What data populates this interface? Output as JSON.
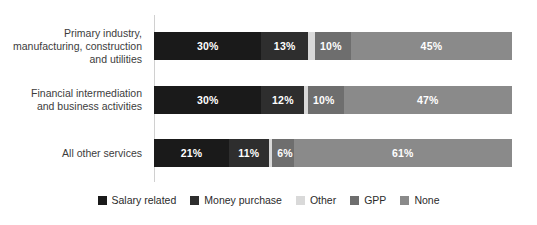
{
  "chart_data": {
    "type": "bar",
    "subtype": "stacked-horizontal-100",
    "title": "",
    "xlabel": "",
    "ylabel": "",
    "xlim": [
      0,
      100
    ],
    "grid": false,
    "legend_position": "bottom",
    "categories": [
      "Primary industry,\nmanufacturing, construction\nand utilities",
      "Financial intermediation\nand business activities",
      "All other services"
    ],
    "series": [
      {
        "name": "Salary related",
        "color": "#1a1a1a",
        "values": [
          30,
          30,
          21
        ]
      },
      {
        "name": "Money purchase",
        "color": "#2e2e2e",
        "values": [
          13,
          12,
          11
        ]
      },
      {
        "name": "Other",
        "color": "#d9d9d9",
        "values": [
          2,
          1,
          1
        ]
      },
      {
        "name": "GPP",
        "color": "#6e6e6e",
        "values": [
          10,
          10,
          6
        ]
      },
      {
        "name": "None",
        "color": "#8a8a8a",
        "values": [
          45,
          47,
          61
        ]
      }
    ],
    "data_labels": [
      [
        "30%",
        "13%",
        "",
        "10%",
        "45%"
      ],
      [
        "30%",
        "12%",
        "",
        "10%",
        "47%"
      ],
      [
        "21%",
        "11%",
        "",
        "6%",
        "61%"
      ]
    ]
  },
  "legend": {
    "items": [
      {
        "label": "Salary related",
        "color": "#1a1a1a"
      },
      {
        "label": "Money purchase",
        "color": "#2e2e2e"
      },
      {
        "label": "Other",
        "color": "#d9d9d9"
      },
      {
        "label": "GPP",
        "color": "#6e6e6e"
      },
      {
        "label": "None",
        "color": "#8a8a8a"
      }
    ]
  },
  "colors": {
    "background": "#ffffff",
    "axis_line": "#d0d0d0",
    "label_text": "#3c3c3c",
    "legend_text": "#2b2b2b",
    "value_text": "#ffffff"
  }
}
